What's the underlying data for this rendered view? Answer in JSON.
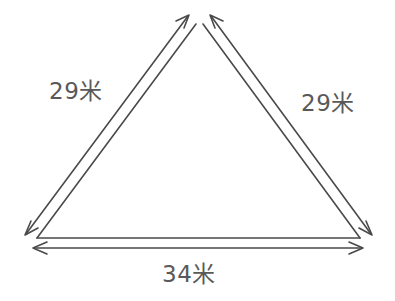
{
  "figure": {
    "kind": "geometry-diagram",
    "shape": "isosceles-triangle",
    "background_color": "#ffffff",
    "stroke_color": "#4a4a4a",
    "label_color": "#595959",
    "unit": "米",
    "labels": {
      "left_side": "29米",
      "right_side": "29米",
      "base": "34米"
    },
    "measurements": [
      {
        "side": "left",
        "value": 29,
        "unit": "米",
        "text": "29米"
      },
      {
        "side": "right",
        "value": 29,
        "unit": "米",
        "text": "29米"
      },
      {
        "side": "base",
        "value": 34,
        "unit": "米",
        "text": "34米"
      }
    ],
    "vertices": {
      "apex": [
        199,
        22
      ],
      "bottom_left": [
        37,
        240
      ],
      "bottom_right": [
        360,
        240
      ]
    }
  }
}
